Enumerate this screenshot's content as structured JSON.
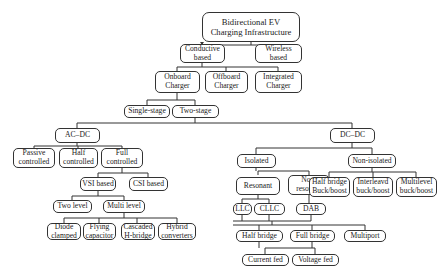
{
  "diagram": {
    "type": "tree",
    "title": "Bidirectional EV Charging Infrastructure",
    "line_color": "#333333",
    "nodes": {
      "root": "Bidirectional EV\nCharging Infrastructure",
      "conductive": "Conductive\nbased",
      "wireless": "Wireless\nbased",
      "onboard": "Onboard\nCharger",
      "offboard": "Offboard\nCharger",
      "integrated": "Integrated\nCharger",
      "single_stage": "Single-stage",
      "two_stage": "Two-stage",
      "acdc": "AC–DC",
      "dcdc": "DC–DC",
      "passive": "Passive\ncontrolled",
      "half_controlled": "Half\ncontrolled",
      "full_controlled": "Full\ncontrolled",
      "vsi": "VSI based",
      "csi": "CSI based",
      "two_level": "Two level",
      "multi_level": "Multi level",
      "diode": "Diode\nclamped",
      "flying": "Flying\ncapacitor",
      "cascaded": "Cascaded\nH-bridge",
      "hybrid": "Hybrid\nconverters",
      "isolated": "Isolated",
      "non_isolated": "Non-isolated",
      "resonant": "Resonant",
      "non_resonant": "Non-\nresonant",
      "hb_buckboost": "Half bridge\nBuck/boost",
      "interleaved": "Interleavd\nbuck/boost",
      "multilevel_bb": "Multilevel\nbuck/boost",
      "llc": "LLC",
      "cllc": "CLLC",
      "dab": "DAB",
      "half_bridge": "Half bridge",
      "full_bridge": "Full bridge",
      "multiport": "Multiport",
      "current_fed": "Current fed",
      "voltage_fed": "Voltage fed"
    },
    "edges": [
      [
        "root",
        "conductive"
      ],
      [
        "root",
        "wireless"
      ],
      [
        "conductive",
        "onboard"
      ],
      [
        "conductive",
        "offboard"
      ],
      [
        "conductive",
        "integrated"
      ],
      [
        "onboard",
        "single_stage"
      ],
      [
        "onboard",
        "two_stage"
      ],
      [
        "two_stage",
        "acdc"
      ],
      [
        "two_stage",
        "dcdc"
      ],
      [
        "acdc",
        "passive"
      ],
      [
        "acdc",
        "half_controlled"
      ],
      [
        "acdc",
        "full_controlled"
      ],
      [
        "full_controlled",
        "vsi"
      ],
      [
        "full_controlled",
        "csi"
      ],
      [
        "vsi",
        "two_level"
      ],
      [
        "vsi",
        "multi_level"
      ],
      [
        "multi_level",
        "diode"
      ],
      [
        "multi_level",
        "flying"
      ],
      [
        "multi_level",
        "cascaded"
      ],
      [
        "multi_level",
        "hybrid"
      ],
      [
        "dcdc",
        "isolated"
      ],
      [
        "dcdc",
        "non_isolated"
      ],
      [
        "non_isolated",
        "hb_buckboost"
      ],
      [
        "non_isolated",
        "interleaved"
      ],
      [
        "non_isolated",
        "multilevel_bb"
      ],
      [
        "isolated",
        "resonant"
      ],
      [
        "isolated",
        "non_resonant"
      ],
      [
        "resonant",
        "llc"
      ],
      [
        "resonant",
        "cllc"
      ],
      [
        "non_resonant",
        "dab"
      ],
      [
        "llc",
        "half_bridge"
      ],
      [
        "cllc",
        "full_bridge"
      ],
      [
        "dab",
        "multiport"
      ],
      [
        "half_bridge",
        "current_fed"
      ],
      [
        "full_bridge",
        "voltage_fed"
      ]
    ]
  }
}
